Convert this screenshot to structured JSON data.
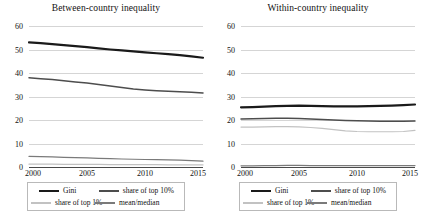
{
  "figure": {
    "panels": [
      {
        "id": "between-country",
        "title": "Between-country inequality",
        "ylim": [
          0,
          60
        ],
        "yticks": [
          0,
          10,
          20,
          30,
          40,
          50,
          60
        ],
        "xlim": [
          2000,
          2015
        ],
        "xticks": [
          2000,
          2005,
          2010,
          2015
        ],
        "xtick_labels": [
          "2000",
          "2005",
          "2010",
          "2015"
        ],
        "ytick_labels": [
          "0",
          "10",
          "20",
          "30",
          "40",
          "50",
          "60"
        ]
      },
      {
        "id": "within-country",
        "title": "Within-country inequality",
        "ylim": [
          0,
          60
        ],
        "yticks": [
          0,
          10,
          20,
          30,
          40,
          50,
          60
        ],
        "xlim": [
          2000,
          2015
        ],
        "xticks": [
          2000,
          2005,
          2010,
          2015
        ],
        "xtick_labels": [
          "2000",
          "2005",
          "2010",
          "2015"
        ],
        "ytick_labels": [
          "0",
          "10",
          "20",
          "30",
          "40",
          "50",
          "60"
        ]
      }
    ],
    "legend": {
      "items": [
        {
          "label": "Gini",
          "color": "#1a1a1a",
          "width": 2.2
        },
        {
          "label": "share of top 10%",
          "color": "#4d4d4d",
          "width": 1.5
        },
        {
          "label": "share of top 1%",
          "color": "#c2c2c2",
          "width": 1.2
        },
        {
          "label": "mean/median",
          "color": "#7a7a7a",
          "width": 1.2
        }
      ],
      "position": "bottom-center",
      "columns": 2,
      "box": true
    }
  },
  "chart_data": [
    {
      "type": "line",
      "title": "Between-country inequality",
      "xlabel": "",
      "ylabel": "",
      "xlim": [
        2000,
        2015
      ],
      "ylim": [
        0,
        60
      ],
      "grid": true,
      "legend_position": "bottom",
      "x": [
        2000,
        2001,
        2002,
        2003,
        2004,
        2005,
        2006,
        2007,
        2008,
        2009,
        2010,
        2011,
        2012,
        2013,
        2014,
        2015
      ],
      "series": [
        {
          "name": "Gini",
          "color": "#1a1a1a",
          "values": [
            53.0,
            52.7,
            52.3,
            51.9,
            51.4,
            51.0,
            50.5,
            50.0,
            49.6,
            49.2,
            48.8,
            48.4,
            48.0,
            47.6,
            47.1,
            46.5
          ]
        },
        {
          "name": "share of top 10%",
          "color": "#4d4d4d",
          "values": [
            38.0,
            37.6,
            37.2,
            36.7,
            36.2,
            35.7,
            35.1,
            34.5,
            33.8,
            33.2,
            32.8,
            32.5,
            32.2,
            32.0,
            31.8,
            31.5
          ]
        },
        {
          "name": "share of top 1%",
          "color": "#c2c2c2",
          "values": [
            1.2,
            1.2,
            1.2,
            1.1,
            1.1,
            1.1,
            1.1,
            1.0,
            1.0,
            1.0,
            1.0,
            1.0,
            0.9,
            0.9,
            0.9,
            0.9
          ]
        },
        {
          "name": "mean/median",
          "color": "#7a7a7a",
          "values": [
            4.5,
            4.4,
            4.3,
            4.1,
            4.0,
            3.9,
            3.7,
            3.6,
            3.4,
            3.3,
            3.2,
            3.1,
            3.0,
            2.9,
            2.7,
            2.5
          ]
        }
      ]
    },
    {
      "type": "line",
      "title": "Within-country inequality",
      "xlabel": "",
      "ylabel": "",
      "xlim": [
        2000,
        2015
      ],
      "ylim": [
        0,
        60
      ],
      "grid": true,
      "legend_position": "bottom",
      "x": [
        2000,
        2001,
        2002,
        2003,
        2004,
        2005,
        2006,
        2007,
        2008,
        2009,
        2010,
        2011,
        2012,
        2013,
        2014,
        2015
      ],
      "series": [
        {
          "name": "Gini",
          "color": "#1a1a1a",
          "values": [
            25.4,
            25.5,
            25.7,
            25.9,
            26.0,
            26.1,
            26.0,
            25.9,
            25.8,
            25.8,
            25.8,
            25.9,
            26.0,
            26.1,
            26.3,
            26.6
          ]
        },
        {
          "name": "share of top 10%",
          "color": "#4d4d4d",
          "values": [
            20.4,
            20.5,
            20.6,
            20.7,
            20.7,
            20.6,
            20.4,
            20.2,
            20.0,
            19.8,
            19.7,
            19.6,
            19.5,
            19.5,
            19.5,
            19.6
          ]
        },
        {
          "name": "share of top 1%",
          "color": "#c2c2c2",
          "values": [
            17.0,
            17.0,
            17.1,
            17.2,
            17.2,
            17.1,
            16.8,
            16.4,
            15.9,
            15.4,
            15.1,
            15.0,
            15.0,
            15.0,
            15.1,
            15.6
          ]
        },
        {
          "name": "mean/median",
          "color": "#7a7a7a",
          "values": [
            0.5,
            0.5,
            0.6,
            0.6,
            0.7,
            0.7,
            0.6,
            0.6,
            0.6,
            0.6,
            0.6,
            0.6,
            0.6,
            0.6,
            0.6,
            0.6
          ]
        }
      ]
    }
  ]
}
